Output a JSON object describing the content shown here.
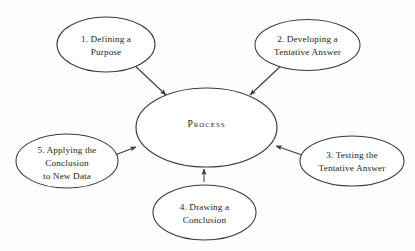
{
  "diagram": {
    "background_color": "#fdfdfd",
    "line_color": "#3a3a3a",
    "text_color": "#1d1d1d",
    "center": {
      "label": "Process"
    },
    "nodes": [
      {
        "id": "node-1",
        "number": "1.",
        "lines": [
          "1.  Defining a",
          "Purpose"
        ],
        "line1": "1.  Defining a",
        "line2": "Purpose",
        "line3": "",
        "position": "top-left"
      },
      {
        "id": "node-2",
        "number": "2.",
        "lines": [
          "2.  Developing a",
          "Tentative Answer"
        ],
        "line1": "2.  Developing a",
        "line2": "Tentative Answer",
        "line3": "",
        "position": "top-right"
      },
      {
        "id": "node-3",
        "number": "3.",
        "lines": [
          "3.  Testing the",
          "Tentative Answer"
        ],
        "line1": "3.  Testing the",
        "line2": "Tentative Answer",
        "line3": "",
        "position": "right"
      },
      {
        "id": "node-4",
        "number": "4.",
        "lines": [
          "4.  Drawing a",
          "Conclusion"
        ],
        "line1": "4.  Drawing a",
        "line2": "Conclusion",
        "line3": "",
        "position": "bottom"
      },
      {
        "id": "node-5",
        "number": "5.",
        "lines": [
          "5.  Applying the",
          "Conclusion",
          "to New Data"
        ],
        "line1": "5.  Applying the",
        "line2": "Conclusion",
        "line3": "to New Data",
        "position": "left"
      }
    ],
    "arrows": [
      {
        "from": "node-1",
        "to": "center",
        "direction": "down-right"
      },
      {
        "from": "node-2",
        "to": "center",
        "direction": "down-left"
      },
      {
        "from": "node-3",
        "to": "center",
        "direction": "left"
      },
      {
        "from": "node-4",
        "to": "center",
        "direction": "up"
      },
      {
        "from": "node-5",
        "to": "center",
        "direction": "right"
      }
    ]
  }
}
